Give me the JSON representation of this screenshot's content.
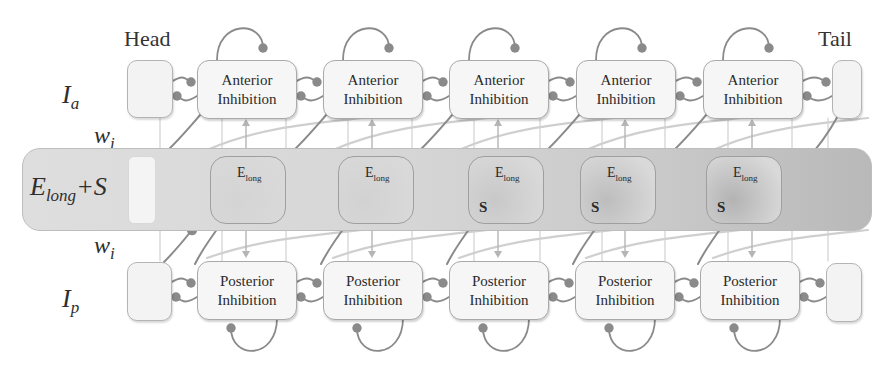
{
  "diagram": {
    "type": "neural-circuit-chain",
    "head_label": "Head",
    "tail_label": "Tail",
    "row_labels": {
      "anterior": {
        "symbol": "I",
        "subscript": "a"
      },
      "weight_top": {
        "symbol": "w",
        "subscript": "i"
      },
      "middle": {
        "symbol": "E",
        "subscript": "long",
        "suffix": "+S"
      },
      "weight_bottom": {
        "symbol": "w",
        "subscript": "i"
      },
      "posterior": {
        "symbol": "I",
        "subscript": "p"
      }
    },
    "anterior_units": [
      {
        "line1": "Anterior",
        "line2": "Inhibition"
      },
      {
        "line1": "Anterior",
        "line2": "Inhibition"
      },
      {
        "line1": "Anterior",
        "line2": "Inhibition"
      },
      {
        "line1": "Anterior",
        "line2": "Inhibition"
      },
      {
        "line1": "Anterior",
        "line2": "Inhibition"
      }
    ],
    "excitatory_units": [
      {
        "main": "E",
        "sub": "long",
        "s_label": "",
        "fill": "#d4d4d4"
      },
      {
        "main": "E",
        "sub": "long",
        "s_label": "",
        "fill": "#d2d2d2"
      },
      {
        "main": "E",
        "sub": "long",
        "s_label": "S",
        "fill": "#c8c8c8"
      },
      {
        "main": "E",
        "sub": "long",
        "s_label": "S",
        "fill": "#bdbdbd"
      },
      {
        "main": "E",
        "sub": "long",
        "s_label": "S",
        "fill": "#b3b3b3"
      }
    ],
    "posterior_units": [
      {
        "line1": "Posterior",
        "line2": "Inhibition"
      },
      {
        "line1": "Posterior",
        "line2": "Inhibition"
      },
      {
        "line1": "Posterior",
        "line2": "Inhibition"
      },
      {
        "line1": "Posterior",
        "line2": "Inhibition"
      },
      {
        "line1": "Posterior",
        "line2": "Inhibition"
      }
    ],
    "colors": {
      "wire": "#8a8a8a",
      "light_wire": "#c9c9c9",
      "box_border": "#a9a9a9",
      "band_start": "#dedede",
      "band_end": "#b9b9b9"
    }
  }
}
